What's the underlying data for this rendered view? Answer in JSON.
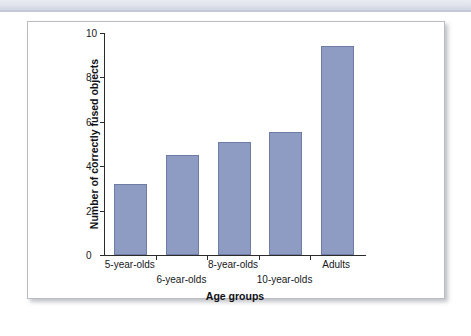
{
  "figure": {
    "card_border_color": "#b9bcc4",
    "background_color": "#ffffff",
    "top_band_color": "#dfe3ec"
  },
  "chart_data": {
    "type": "bar",
    "title": "",
    "xlabel": "Age groups",
    "ylabel": "Number of correctly fused objects",
    "categories": [
      "5-year-olds",
      "6-year-olds",
      "8-year-olds",
      "10-year-olds",
      "Adults"
    ],
    "values": [
      3.2,
      4.5,
      5.1,
      5.55,
      9.4
    ],
    "ylim": [
      0,
      10
    ],
    "yticks": [
      0,
      2,
      4,
      6,
      8,
      10
    ],
    "ytick_labels": [
      "0",
      "2",
      "4",
      "6",
      "8",
      "10"
    ],
    "grid": false,
    "legend": null,
    "bar_color": "#8e9cc4",
    "bar_edge_color": "#6e7ba4",
    "label_rows": [
      0,
      1,
      0,
      1,
      0
    ]
  }
}
